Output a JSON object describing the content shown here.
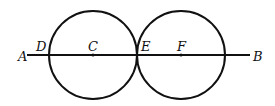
{
  "diagram": {
    "line": {
      "from": "A",
      "to": "B",
      "x1": 27,
      "y1": 55,
      "x2": 250,
      "y2": 55
    },
    "circles": [
      {
        "center": "C",
        "cx": 93,
        "cy": 55,
        "r": 44
      },
      {
        "center": "F",
        "cx": 181,
        "cy": 55,
        "r": 44
      }
    ],
    "points": [
      {
        "label": "A",
        "x": 18,
        "y": 61
      },
      {
        "label": "D",
        "x": 36,
        "y": 51
      },
      {
        "label": "C",
        "x": 88,
        "y": 51
      },
      {
        "label": "E",
        "x": 141,
        "y": 51
      },
      {
        "label": "F",
        "x": 177,
        "y": 51
      },
      {
        "label": "B",
        "x": 253,
        "y": 61
      }
    ],
    "stroke_color": "#111111"
  }
}
